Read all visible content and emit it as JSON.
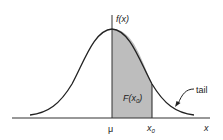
{
  "diagram": {
    "type": "normal-distribution-curve",
    "labels": {
      "y_axis": "f(x)",
      "x_axis": "x",
      "mean": "μ",
      "x0": "x",
      "x0_sub": "0",
      "area_prefix": "F(x",
      "area_sub": "0",
      "area_suffix": ")",
      "tail": "tail"
    },
    "colors": {
      "curve": "#222222",
      "shade": "#bdbdbd",
      "axis": "#333333"
    }
  }
}
